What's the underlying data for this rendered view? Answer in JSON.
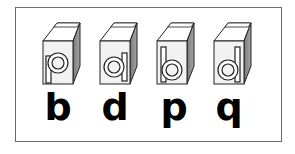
{
  "figure": {
    "blocks": [
      {
        "face_letter": "p",
        "printed_letter": "b"
      },
      {
        "face_letter": "a",
        "printed_letter": "d"
      },
      {
        "face_letter": "b",
        "printed_letter": "p"
      },
      {
        "face_letter": "d",
        "printed_letter": "q"
      }
    ],
    "colors": {
      "frame_border": "#6a6a6a",
      "block_front": "#f2f2f2",
      "block_top": "#ffffff",
      "block_side": "#8a8a8a",
      "outline": "#222222",
      "printed_letter": "#000000"
    }
  }
}
